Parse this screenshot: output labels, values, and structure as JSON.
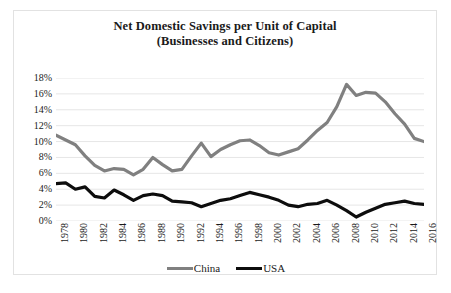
{
  "chart": {
    "title_line1": "Net Domestic Savings per Unit of Capital",
    "title_line2": "(Businesses and Citizens)"
  },
  "legend": {
    "position": "bottom",
    "items": [
      {
        "label": "China",
        "color": "#808080"
      },
      {
        "label": "USA",
        "color": "#0d0d0d"
      }
    ]
  },
  "colors": {
    "china": "#808080",
    "usa": "#0d0d0d",
    "gridline": "#e6e6e6",
    "border": "#e2e2e2",
    "text": "#1a1a1a"
  },
  "chart_data": {
    "type": "line",
    "title": "Net Domestic Savings per Unit of Capital (Businesses and Citizens)",
    "xlabel": "",
    "ylabel": "",
    "grid": true,
    "legend_position": "bottom",
    "ylim": [
      0,
      18
    ],
    "ytick_labels": [
      "0%",
      "2%",
      "4%",
      "6%",
      "8%",
      "10%",
      "12%",
      "14%",
      "16%",
      "18%"
    ],
    "ytick_values": [
      0,
      2,
      4,
      6,
      8,
      10,
      12,
      14,
      16,
      18
    ],
    "xlim": [
      1978,
      2016
    ],
    "xtick_labels": [
      "1978",
      "1980",
      "1982",
      "1984",
      "1986",
      "1988",
      "1990",
      "1992",
      "1994",
      "1996",
      "1998",
      "2000",
      "2002",
      "2004",
      "2006",
      "2008",
      "2010",
      "2012",
      "2014",
      "2016"
    ],
    "x": [
      1978,
      1979,
      1980,
      1981,
      1982,
      1983,
      1984,
      1985,
      1986,
      1987,
      1988,
      1989,
      1990,
      1991,
      1992,
      1993,
      1994,
      1995,
      1996,
      1997,
      1998,
      1999,
      2000,
      2001,
      2002,
      2003,
      2004,
      2005,
      2006,
      2007,
      2008,
      2009,
      2010,
      2011,
      2012,
      2013,
      2014,
      2015,
      2016
    ],
    "series": [
      {
        "name": "China",
        "color": "#808080",
        "values": [
          10.8,
          10.2,
          9.6,
          8.2,
          7.0,
          6.3,
          6.6,
          6.5,
          5.8,
          6.5,
          8.0,
          7.1,
          6.3,
          6.5,
          8.2,
          9.8,
          8.1,
          9.0,
          9.6,
          10.1,
          10.2,
          9.5,
          8.6,
          8.3,
          8.7,
          9.1,
          10.2,
          11.4,
          12.4,
          14.4,
          17.2,
          15.8,
          16.2,
          16.1,
          15.0,
          13.5,
          12.2,
          10.4,
          10.0
        ]
      },
      {
        "name": "USA",
        "color": "#0d0d0d",
        "values": [
          4.7,
          4.8,
          4.0,
          4.3,
          3.1,
          2.9,
          3.9,
          3.3,
          2.6,
          3.2,
          3.4,
          3.2,
          2.5,
          2.4,
          2.3,
          1.8,
          2.2,
          2.6,
          2.8,
          3.2,
          3.6,
          3.3,
          3.0,
          2.6,
          2.0,
          1.8,
          2.1,
          2.2,
          2.6,
          2.0,
          1.3,
          0.5,
          1.1,
          1.6,
          2.1,
          2.3,
          2.5,
          2.2,
          2.1
        ]
      }
    ]
  }
}
